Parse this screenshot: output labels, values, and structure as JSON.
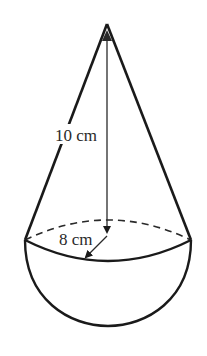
{
  "diagram": {
    "type": "cone-on-hemisphere solid",
    "labels": {
      "height": "10 cm",
      "radius": "8 cm"
    },
    "colors": {
      "stroke": "#1a1a1a",
      "background": "#ffffff"
    }
  }
}
